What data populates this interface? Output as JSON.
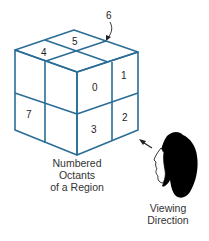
{
  "diagram": {
    "title": "Numbered Octants of a Region",
    "octants": [
      {
        "id": "0",
        "label": "0"
      },
      {
        "id": "1",
        "label": "1"
      },
      {
        "id": "2",
        "label": "2"
      },
      {
        "id": "3",
        "label": "3"
      },
      {
        "id": "4",
        "label": "4"
      },
      {
        "id": "5",
        "label": "5"
      },
      {
        "id": "6",
        "label": "6"
      },
      {
        "id": "7",
        "label": "7"
      }
    ],
    "caption_lines": [
      "Numbered",
      "Octants",
      "of a Region"
    ],
    "viewer_caption_lines": [
      "Viewing",
      "Direction"
    ],
    "colors": {
      "cube_lines": "#2a6d96",
      "text": "#333333",
      "viewer": "#000000"
    }
  }
}
